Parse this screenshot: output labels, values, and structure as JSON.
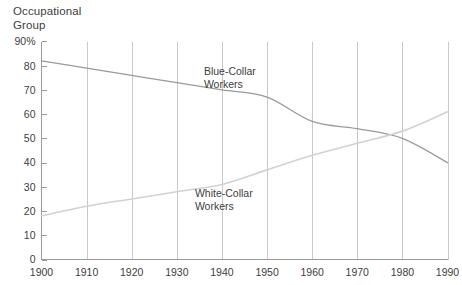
{
  "chart_data": {
    "type": "line",
    "title": "Occupational Group",
    "title_line1": "Occupational",
    "title_line2": "Group",
    "xlabel": "",
    "ylabel": "Occupational Group",
    "x": [
      1900,
      1910,
      1920,
      1930,
      1940,
      1950,
      1960,
      1970,
      1980,
      1990
    ],
    "categories": [
      "1900",
      "1910",
      "1920",
      "1930",
      "1940",
      "1950",
      "1960",
      "1970",
      "1980",
      "1990"
    ],
    "xlim": [
      1900,
      1990
    ],
    "ylim": [
      0,
      90
    ],
    "yticks": [
      0,
      10,
      20,
      30,
      40,
      50,
      60,
      70,
      80,
      90
    ],
    "ytick_labels": [
      "0",
      "10",
      "20",
      "30",
      "40",
      "50",
      "60",
      "70",
      "80",
      "90%"
    ],
    "xticks": [
      1900,
      1910,
      1920,
      1930,
      1940,
      1950,
      1960,
      1970,
      1980,
      1990
    ],
    "xtick_labels": [
      "1900",
      "1910",
      "1920",
      "1930",
      "1940",
      "1950",
      "1960",
      "1970",
      "1980",
      "1990"
    ],
    "grid": "vertical-only",
    "legend": "inline-annotations",
    "series": [
      {
        "name": "Blue-Collar Workers",
        "label": "Blue-Collar Workers",
        "label_line1": "Blue-Collar",
        "label_line2": "Workers",
        "color": "#9a9a9a",
        "values": [
          82,
          79,
          76,
          73,
          70,
          67,
          57,
          54,
          50,
          40
        ]
      },
      {
        "name": "White-Collar Workers",
        "label": "White-Collar Workers",
        "label_line1": "White-Collar",
        "label_line2": "Workers",
        "color": "#d2d2d2",
        "values": [
          18,
          22,
          25,
          28,
          31,
          37,
          43,
          48,
          53,
          61
        ]
      }
    ],
    "annotations": [
      {
        "text": "Blue-Collar Workers",
        "x": 1936,
        "y": 76
      },
      {
        "text": "White-Collar Workers",
        "x": 1934,
        "y": 26
      }
    ],
    "crossover": {
      "x": 1979,
      "y": 50
    }
  },
  "colors": {
    "background": "#ffffff",
    "axis": "#9a9a9a",
    "grid": "#c8c8c8",
    "text": "#404040",
    "blue_collar": "#9a9a9a",
    "white_collar": "#d2d2d2"
  }
}
